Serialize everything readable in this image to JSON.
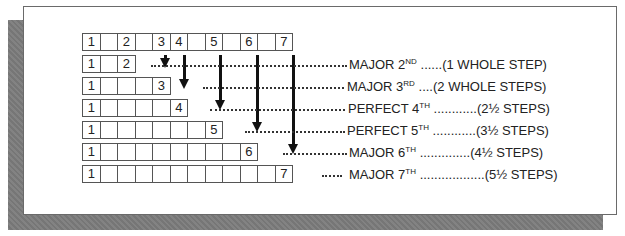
{
  "diagram": {
    "scale_row": {
      "cells": [
        "1",
        "",
        "2",
        "",
        "3",
        "4",
        "",
        "5",
        "",
        "6",
        "",
        "7"
      ]
    },
    "intervals": [
      {
        "top_degree": "2",
        "cells": 3,
        "name": "MAJOR 2",
        "suffix": "ND",
        "dots_before": "..............",
        "dots_after": "......",
        "steps": "(1 WHOLE STEP)"
      },
      {
        "top_degree": "3",
        "cells": 5,
        "name": "MAJOR 3",
        "suffix": "RD",
        "dots_before": "............",
        "dots_after": "....",
        "steps": "(2 WHOLE STEPS)"
      },
      {
        "top_degree": "4",
        "cells": 6,
        "name": "PERFECT 4",
        "suffix": "TH",
        "dots_before": "............ ",
        "dots_after": "............",
        "steps": "(2½ STEPS)"
      },
      {
        "top_degree": "5",
        "cells": 8,
        "name": "PERFECT 5",
        "suffix": "TH",
        "dots_before": "............",
        "dots_after": "............",
        "steps": "(3½ STEPS)"
      },
      {
        "top_degree": "6",
        "cells": 10,
        "name": "MAJOR 6",
        "suffix": "TH",
        "dots_before": "............",
        "dots_after": "..............",
        "steps": "(4½ STEPS)"
      },
      {
        "top_degree": "7",
        "cells": 12,
        "name": "MAJOR 7",
        "suffix": "TH",
        "dots_before": "...... ",
        "dots_after": "..................",
        "steps": "(5½ STEPS)"
      }
    ],
    "root_label": "1"
  }
}
